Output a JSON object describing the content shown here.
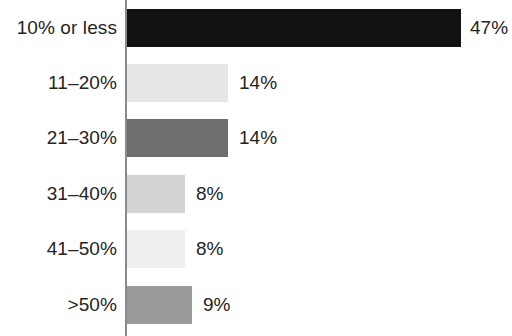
{
  "chart_data": {
    "type": "bar",
    "orientation": "horizontal",
    "title": "",
    "subtitle": "",
    "xlabel": "",
    "ylabel": "",
    "grid": false,
    "legend": false,
    "xlim": [
      0,
      50
    ],
    "categories": [
      "10% or less",
      "11–20%",
      "21–30%",
      "31–40%",
      "41–50%",
      ">50%"
    ],
    "values": [
      47,
      14,
      14,
      8,
      8,
      9
    ],
    "value_labels": [
      "47%",
      "14%",
      "14%",
      "8%",
      "8%",
      "9%"
    ],
    "bar_colors": [
      "#121212",
      "#e6e6e6",
      "#6e6e6e",
      "#d2d2d2",
      "#efefef",
      "#9a9a9a"
    ],
    "axis_color": "#8a8a8a",
    "text_color": "#242424",
    "background": "#ffffff",
    "bars": [
      {
        "category": "10% or less",
        "value": 47,
        "label": "47%",
        "color": "#121212",
        "bar_px": 334,
        "label_x": 470
      },
      {
        "category": "11–20%",
        "value": 14,
        "label": "14%",
        "color": "#e6e6e6",
        "bar_px": 101,
        "label_x": 239
      },
      {
        "category": "21–30%",
        "value": 14,
        "label": "14%",
        "color": "#6e6e6e",
        "bar_px": 101,
        "label_x": 239
      },
      {
        "category": "31–40%",
        "value": 8,
        "label": "8%",
        "color": "#d2d2d2",
        "bar_px": 58,
        "label_x": 196
      },
      {
        "category": "41–50%",
        "value": 8,
        "label": "8%",
        "color": "#efefef",
        "bar_px": 58,
        "label_x": 196
      },
      {
        "category": ">50%",
        "value": 9,
        "label": "9%",
        "color": "#9a9a9a",
        "bar_px": 65,
        "label_x": 203
      }
    ]
  }
}
